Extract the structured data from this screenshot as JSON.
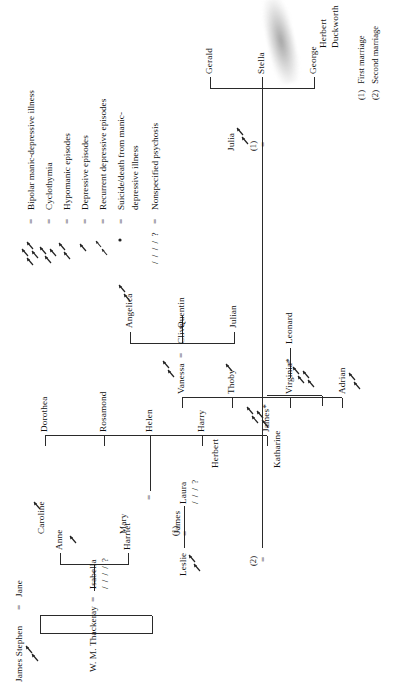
{
  "document": {
    "type": "genealogy-chart",
    "title": "Family tree with psychiatric annotations",
    "orientation": "rotated-90-counterclockwise"
  },
  "people": {
    "james_stephen": "James Stephen",
    "jane": "Jane",
    "wm_thackeray": "W. M. Thackeray",
    "isabella": "Isabella",
    "harriet": "Harriet",
    "anne": "Anne",
    "james": "James",
    "mary": "Mary",
    "caroline": "Caroline",
    "leslie": "Leslie",
    "laura": "Laura",
    "katharine": "Katharine",
    "herbert": "Herbert",
    "james_star": "James*",
    "harry": "Harry",
    "helen": "Helen",
    "rosamond": "Rosamond",
    "dorothea": "Dorothea",
    "adrian": "Adrian",
    "leonard": "Leonard",
    "virginia_star": "Virginia*",
    "thoby": "Thoby",
    "vanessa": "Vanessa",
    "clive": "Clive",
    "julian": "Julian",
    "quentin": "Quentin",
    "angelica": "Angelica",
    "julia": "Julia",
    "herbert_duckworth": "Herbert",
    "duckworth": "Duckworth",
    "george": "George",
    "stella": "Stella",
    "gerald": "Gerald"
  },
  "symbols": {
    "equals": "=",
    "marriage_one": "(1)",
    "marriage_two": "(2)",
    "unspecified": "/ / / / ?",
    "unspecified_short": "/ / / ?"
  },
  "legend": {
    "items": [
      {
        "symbol": "four-arrows",
        "equals": "=",
        "label": "Bipolar manic-depressive illness"
      },
      {
        "symbol": "three-arrows",
        "equals": "=",
        "label": "Cyclothymia"
      },
      {
        "symbol": "two-arrows",
        "equals": "=",
        "label": "Hypomanic episodes"
      },
      {
        "symbol": "one-arrow",
        "equals": "=",
        "label": "Depressive episodes"
      },
      {
        "symbol": "two-small-arrows",
        "equals": "=",
        "label": "Recurrent depressive episodes"
      },
      {
        "symbol": "dot-arrow",
        "equals": "=",
        "label": "Suicide/death from manic-"
      },
      {
        "symbol": "",
        "equals": "",
        "label": "depressive illness"
      },
      {
        "symbol": "slashes",
        "equals": "=",
        "label": "Nonspecified psychosis"
      }
    ],
    "slashes_glyph": "/ / / / ?"
  },
  "footnotes": [
    {
      "marker": "(1)",
      "text": "First marriage"
    },
    {
      "marker": "(2)",
      "text": "Second marriage"
    }
  ],
  "colors": {
    "ink": "#2a2a2a",
    "paper": "#ffffff"
  }
}
